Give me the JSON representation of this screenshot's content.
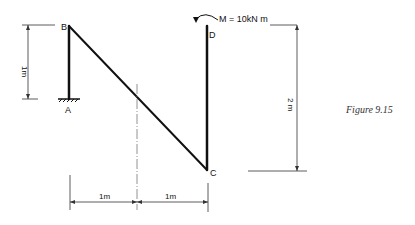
{
  "figure": {
    "caption": "Figure 9.15",
    "nodes": {
      "A": "A",
      "B": "B",
      "C": "C",
      "D": "D"
    },
    "moment_label": "M = 10kN m",
    "dimensions": {
      "left_height": "1m",
      "right_height": "2 m",
      "bottom_left": "1m",
      "bottom_right": "1m"
    }
  },
  "colors": {
    "member": "#111111",
    "dimension": "#333333",
    "background": "#ffffff"
  }
}
